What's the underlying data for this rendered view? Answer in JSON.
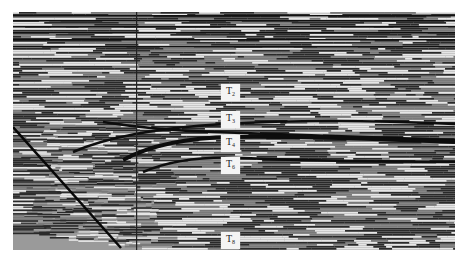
{
  "figure": {
    "horizons": [
      {
        "label": "T",
        "sub": "2",
        "x": 221,
        "y": 84
      },
      {
        "label": "T",
        "sub": "3",
        "x": 221,
        "y": 111
      },
      {
        "label": "T",
        "sub": "4",
        "x": 221,
        "y": 135
      },
      {
        "label": "T",
        "sub": "6",
        "x": 221,
        "y": 157
      },
      {
        "label": "T",
        "sub": "8",
        "x": 221,
        "y": 232
      }
    ],
    "colors": {
      "trace_dark": "#1a1a1a",
      "trace_light": "#e8e8e8",
      "background": "#ffffff"
    }
  }
}
